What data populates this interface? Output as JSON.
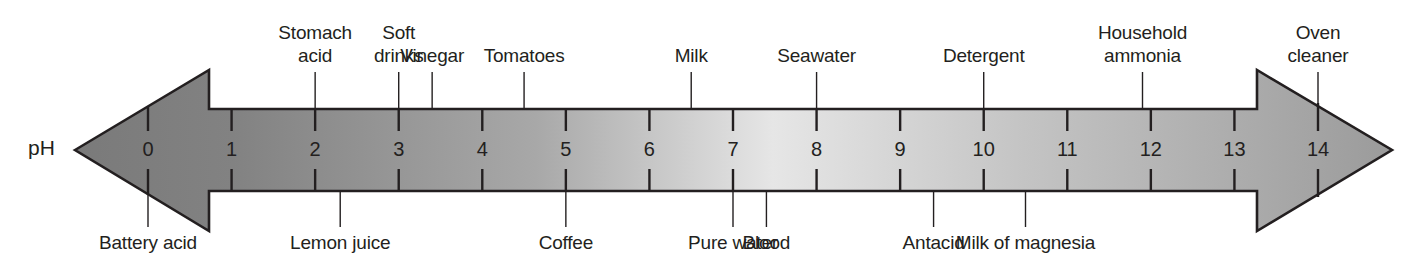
{
  "diagram": {
    "axis_label": "pH",
    "scale": {
      "min": 0,
      "max": 14,
      "ticks": [
        "0",
        "1",
        "2",
        "3",
        "4",
        "5",
        "6",
        "7",
        "8",
        "9",
        "10",
        "11",
        "12",
        "13",
        "14"
      ]
    },
    "colors": {
      "acid_end": "#7a7a7a",
      "neutral": "#e6e6e6",
      "base_end": "#9b9b9b",
      "outline": "#231f20",
      "text": "#231f20"
    },
    "top_labels": [
      {
        "text": "Stomach\nacid",
        "ph": 2.0
      },
      {
        "text": "Soft\ndrinks",
        "ph": 3.0
      },
      {
        "text": "Vinegar",
        "ph": 3.4
      },
      {
        "text": "Tomatoes",
        "ph": 4.5
      },
      {
        "text": "Milk",
        "ph": 6.5
      },
      {
        "text": "Seawater",
        "ph": 8.0
      },
      {
        "text": "Detergent",
        "ph": 10.0
      },
      {
        "text": "Household\nammonia",
        "ph": 11.9
      },
      {
        "text": "Oven\ncleaner",
        "ph": 14.0
      }
    ],
    "bottom_labels": [
      {
        "text": "Battery acid",
        "ph": 0.0
      },
      {
        "text": "Lemon juice",
        "ph": 2.3
      },
      {
        "text": "Coffee",
        "ph": 5.0
      },
      {
        "text": "Pure water",
        "ph": 7.0
      },
      {
        "text": "Blood",
        "ph": 7.4
      },
      {
        "text": "Antacid",
        "ph": 9.4
      },
      {
        "text": "Milk of magnesia",
        "ph": 10.5
      }
    ]
  }
}
